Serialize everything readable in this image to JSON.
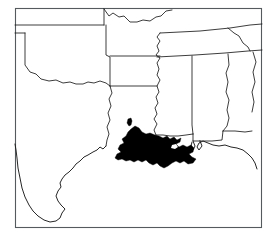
{
  "figure": {
    "title": "",
    "kind": "distribution-range-map",
    "region": "Southern United States (Gulf Coast)",
    "background_color": "#ffffff",
    "frame_color": "#555a5e",
    "border_color": "#1a1a1a",
    "range_fill_color": "#000000",
    "width_px": 270,
    "height_px": 235
  },
  "frame": {
    "x": 15,
    "y": 8,
    "width": 247,
    "height": 220
  },
  "legend": {
    "visible": false,
    "entries": []
  },
  "axes": {
    "visible": false,
    "tick_labels": []
  },
  "states": [
    {
      "name": "Kansas",
      "label": ""
    },
    {
      "name": "Missouri",
      "label": ""
    },
    {
      "name": "Kentucky",
      "label": ""
    },
    {
      "name": "Tennessee",
      "label": ""
    },
    {
      "name": "Oklahoma",
      "label": ""
    },
    {
      "name": "Arkansas",
      "label": ""
    },
    {
      "name": "Texas",
      "label": ""
    },
    {
      "name": "Louisiana",
      "label": ""
    },
    {
      "name": "Mississippi",
      "label": ""
    },
    {
      "name": "Alabama",
      "label": ""
    },
    {
      "name": "Georgia",
      "label": ""
    },
    {
      "name": "Florida",
      "label": ""
    }
  ],
  "range_polygons": [
    {
      "id": "main-gulf-coast-range",
      "description": "Southern Louisiana through coastal Mississippi and Alabama"
    },
    {
      "id": "isolated-patch-central-louisiana",
      "description": "Small isolated occurrence in central Louisiana"
    }
  ],
  "annotations": []
}
